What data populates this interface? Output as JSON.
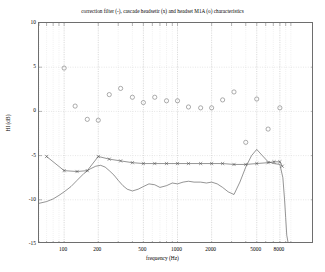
{
  "chart_data": {
    "type": "line",
    "title": "correction filter (-), cascade headsetir (x) and headset M1A (o) characteristics",
    "xlabel": "frequency (Hz)",
    "ylabel": "HI (dB)",
    "xscale": "log",
    "xlim": [
      60,
      16000
    ],
    "ylim": [
      -15,
      10
    ],
    "grid": true,
    "grid_style": "dotted",
    "legend": "none (encoded in title)",
    "xticks": [
      100,
      200,
      500,
      1000,
      2000,
      5000,
      8000
    ],
    "xtick_labels": [
      "100",
      "200",
      "500",
      "1000",
      "2000",
      "5000",
      "8000"
    ],
    "yticks": [
      -15,
      -10,
      -5,
      0,
      5,
      10
    ],
    "ytick_labels": [
      "-15",
      "-10",
      "-5",
      "0",
      "5",
      "10"
    ],
    "series": [
      {
        "name": "correction filter",
        "marker": "none",
        "linestyle": "-",
        "color": "#4d4d4d",
        "x": [
          60,
          70,
          80,
          90,
          100,
          115,
          130,
          150,
          170,
          190,
          210,
          230,
          250,
          275,
          300,
          330,
          360,
          400,
          450,
          500,
          560,
          630,
          700,
          800,
          900,
          1000,
          1120,
          1250,
          1400,
          1600,
          1800,
          2000,
          2240,
          2500,
          2800,
          3150,
          3550,
          4000,
          4500,
          5000,
          5600,
          6300,
          7100,
          8000,
          8500,
          8800,
          9000,
          9200,
          9500
        ],
        "y": [
          -10.4,
          -10.2,
          -9.9,
          -9.5,
          -9.1,
          -8.5,
          -7.8,
          -7.0,
          -6.5,
          -6.2,
          -6.1,
          -6.3,
          -6.7,
          -7.2,
          -7.8,
          -8.4,
          -8.8,
          -9.0,
          -8.8,
          -8.5,
          -8.2,
          -8.3,
          -8.6,
          -8.4,
          -8.1,
          -8.2,
          -8.0,
          -7.9,
          -8.0,
          -8.0,
          -8.1,
          -8.0,
          -8.2,
          -8.6,
          -9.1,
          -9.4,
          -8.0,
          -6.3,
          -5.0,
          -4.3,
          -5.0,
          -5.7,
          -5.9,
          -6.0,
          -7.5,
          -10.0,
          -12.0,
          -14.0,
          -15.0
        ]
      },
      {
        "name": "cascade headsetir",
        "marker": "x",
        "linestyle": "-",
        "color": "#4d4d4d",
        "x": [
          70,
          100,
          130,
          160,
          200,
          250,
          315,
          400,
          500,
          630,
          800,
          1000,
          1250,
          1600,
          2000,
          2500,
          3150,
          4000,
          5000,
          6300,
          7100,
          8000,
          8400
        ],
        "y": [
          -5.1,
          -6.7,
          -6.8,
          -6.7,
          -5.1,
          -5.4,
          -5.6,
          -5.8,
          -5.9,
          -5.9,
          -5.9,
          -5.9,
          -5.9,
          -5.9,
          -5.9,
          -5.9,
          -6.0,
          -6.0,
          -5.9,
          -5.8,
          -5.7,
          -5.7,
          -6.2
        ]
      },
      {
        "name": "headset M1A",
        "marker": "o",
        "linestyle": "none",
        "color": "#808080",
        "x": [
          100,
          125,
          160,
          200,
          250,
          315,
          400,
          500,
          630,
          800,
          1000,
          1250,
          1600,
          2000,
          2500,
          3150,
          4000,
          5000,
          6300,
          8000
        ],
        "y": [
          4.9,
          0.6,
          -0.9,
          -1.0,
          1.9,
          2.6,
          1.6,
          1.0,
          1.6,
          1.2,
          1.2,
          0.5,
          0.4,
          0.4,
          1.3,
          2.2,
          -3.5,
          1.4,
          -2.0,
          0.4
        ]
      }
    ]
  }
}
